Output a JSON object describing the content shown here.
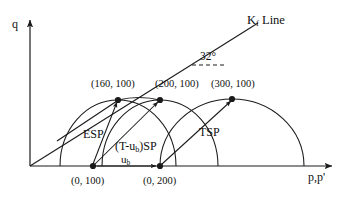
{
  "figure": {
    "type": "stress-path-diagram",
    "axes": {
      "x_label": "p,p'",
      "y_label": "q",
      "origin": {
        "x": 30,
        "y": 166
      }
    },
    "kf_line": {
      "label_text": "K",
      "label_sub": "f",
      "label_suffix": " Line",
      "angle_text": "32°"
    },
    "points": [
      {
        "id": "p160",
        "label": "(160, 100)",
        "x": 118,
        "y": 100
      },
      {
        "id": "p200",
        "label": "(200, 100)",
        "x": 160,
        "y": 100
      },
      {
        "id": "p300",
        "label": "(300, 100)",
        "x": 232,
        "y": 99
      },
      {
        "id": "b100",
        "label": "(0, 100)",
        "x": 93,
        "y": 166
      },
      {
        "id": "b200",
        "label": "(0, 200)",
        "x": 160,
        "y": 166
      }
    ],
    "regions": [
      {
        "id": "esp",
        "label": "ESP"
      },
      {
        "id": "tsp",
        "label": "TSP"
      }
    ],
    "stress_path_label": {
      "prefix": "(T-u",
      "sub": "b",
      "suffix": ")SP"
    },
    "ub_label": {
      "text": "u",
      "sub": "b"
    },
    "colors": {
      "stroke": "#1a1a1a",
      "text": "#111111",
      "background": "#ffffff"
    }
  }
}
